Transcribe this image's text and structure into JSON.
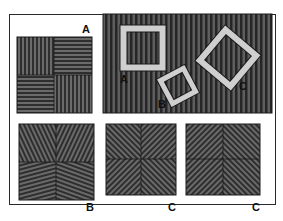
{
  "figure": {
    "colors": {
      "stripe_dark": "#2e2e2e",
      "stripe_light": "#6a6a6a",
      "frame_light": "#cfcfcf",
      "border": "#1a1a1a"
    },
    "panels": {
      "top_left": {
        "label": "A",
        "pattern": "alternating vertical/horizontal stripe quadrants"
      },
      "top_right": {
        "pattern": "vertical stripes",
        "squares": [
          {
            "label": "A",
            "orientation": "upright"
          },
          {
            "label": "B",
            "orientation": "tilted"
          },
          {
            "label": "C",
            "orientation": "diamond"
          }
        ]
      },
      "bottom_left": {
        "label": "B",
        "pattern": "oblique stripe quadrants"
      },
      "bottom_middle": {
        "label": "C",
        "pattern": "diagonal stripes converging to center"
      },
      "bottom_right": {
        "label": "C",
        "pattern": "diagonal chevron stripes"
      }
    }
  }
}
